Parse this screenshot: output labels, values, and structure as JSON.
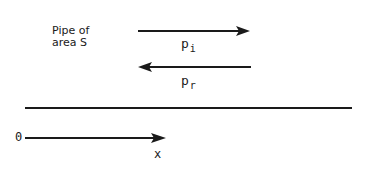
{
  "diagram": {
    "pipe_label_line1": "Pipe of",
    "pipe_label_line2": "area S",
    "incident_wave": {
      "symbol": "p",
      "subscript": "i",
      "direction": "right"
    },
    "reflected_wave": {
      "symbol": "p",
      "subscript": "r",
      "direction": "left"
    },
    "axis": {
      "origin_label": "0",
      "axis_label": "x",
      "direction": "right"
    },
    "colors": {
      "ink": "#1a1a1a",
      "background": "#ffffff"
    }
  }
}
